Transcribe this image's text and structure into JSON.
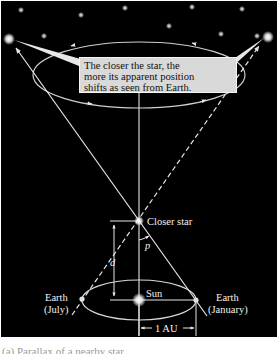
{
  "callout": {
    "lines": [
      "The closer the star, the",
      "more its apparent position",
      "shifts as seen from Earth."
    ]
  },
  "labels": {
    "closer_star": "Closer star",
    "parallax_angle": "p",
    "distance": "d",
    "sun": "Sun",
    "earth_july_line1": "Earth",
    "earth_july_line2": "(July)",
    "earth_january_line1": "Earth",
    "earth_january_line2": "(January)",
    "au": "1 AU"
  },
  "caption": "(a) Parallax of a nearby star",
  "colors": {
    "background": "#000000",
    "line": "#e6e6e6",
    "callout_fill": "#d9d9d9",
    "text": "#f2f2f2"
  },
  "icons": {
    "background_stars": "star-icon",
    "sun": "sun-icon",
    "earth": "earth-icon"
  }
}
